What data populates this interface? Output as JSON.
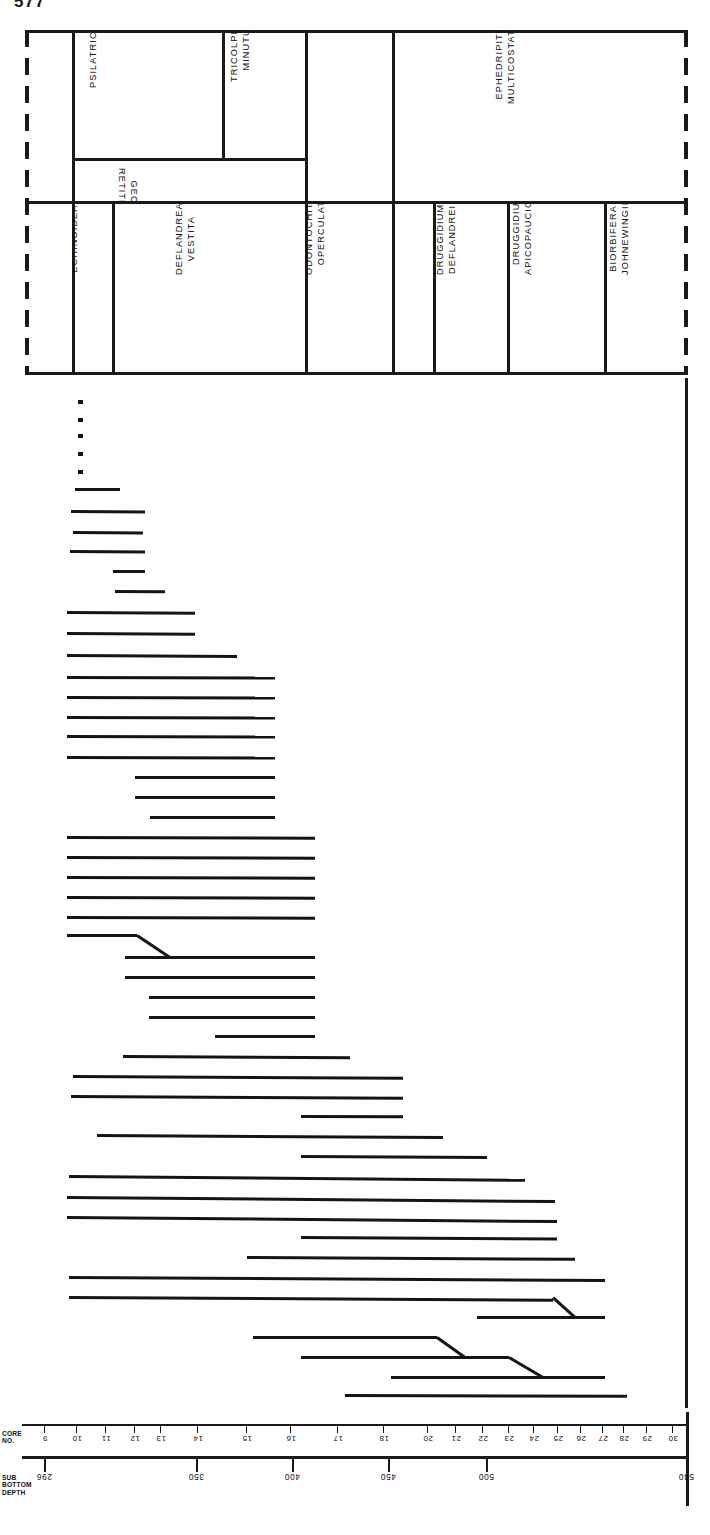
{
  "page_number": "577",
  "header": {
    "top_row": [
      {
        "id": "complexiopollis",
        "label": "COMPLEXIOPOLLIS",
        "lines": [
          "COMPLEXIOPOLLIS"
        ],
        "x": 0,
        "w": 47,
        "orient": "ccw"
      },
      {
        "id": "psilatricolporites",
        "label": "PSILATRICOLPORITES",
        "lines": [
          "PSILATRICOLPORITES"
        ],
        "x": 47,
        "w": 150,
        "orient": "ccw"
      },
      {
        "id": "tricolpites-minutus",
        "label": "TRICOLPITES MINUTUS",
        "lines": [
          "TRICOLPITES",
          "MINUTUS"
        ],
        "x": 197,
        "w": 83,
        "orient": "ccw"
      },
      {
        "id": "clavatipollenites",
        "label": "CLAVATIPOLLENITES",
        "lines": [
          "CLAVATIPOLLENITES"
        ],
        "x": 280,
        "w": 87,
        "orient": "ccw"
      },
      {
        "id": "ephedripites-multicostatus",
        "label": "EPHEDRIPITES MULTICOSTATUS",
        "lines": [
          "EPHEDRIPITES",
          "MULTICOSTATUS"
        ],
        "x": 367,
        "w": 296,
        "orient": "ccw"
      }
    ],
    "inset_row": [
      {
        "id": "retitricolpites-georgensis",
        "label": "RETITRICOLPITES GEORGENSIS",
        "lines": [
          "GEORGENSIS",
          "RETITRICOLPITES"
        ],
        "orient": "cw"
      }
    ],
    "bottom_row": [
      {
        "id": "trithyrodinium-suspectum",
        "label": "TRITHYRODINIUM SUSPECTUM",
        "lines": [
          "TRITHYRODINIUM",
          "SUSPECTUM"
        ],
        "x": 0,
        "w": 47,
        "orient": "ccw"
      },
      {
        "id": "deflandrea-echinoidea",
        "label": "DEFLANDREA ECHINOIDEA",
        "lines": [
          "DEFLANDREA",
          "ECHINOIDEA"
        ],
        "x": 47,
        "w": 40,
        "orient": "ccw"
      },
      {
        "id": "deflandrea-vestita",
        "label": "DEFLANDREA VESTITA",
        "lines": [
          "DEFLANDREA",
          "VESTITA"
        ],
        "x": 87,
        "w": 193,
        "orient": "ccw"
      },
      {
        "id": "odontochitina-operculata",
        "label": "ODONTOCHITINA OPERCULATA",
        "lines": [
          "ODONTOCHITINA",
          "OPERCULATA"
        ],
        "x": 280,
        "w": 87,
        "orient": "ccw"
      },
      {
        "id": "druggidium-rhabdoreticulatum",
        "label": "DRUGGIDIUM RHABDORETICULATUM",
        "lines": [
          "DRUGGIDIUM",
          "RHABDORETICULATUM"
        ],
        "x": 367,
        "w": 41,
        "orient": "ccw"
      },
      {
        "id": "druggidium-deflandrei",
        "label": "DRUGGIDIUM DEFLANDREI",
        "lines": [
          "DRUGGIDIUM",
          "DEFLANDREI"
        ],
        "x": 408,
        "w": 74,
        "orient": "ccw"
      },
      {
        "id": "druggidium-apicopaucicum",
        "label": "DRUGGIDIUM APICOPAUCICUM",
        "lines": [
          "DRUGGIDIUM",
          "APICOPAUCICUM"
        ],
        "x": 482,
        "w": 97,
        "orient": "ccw"
      },
      {
        "id": "biorbifera-johnewingii",
        "label": "BIORBIFERA JOHNEWINGII",
        "lines": [
          "BIORBIFERA",
          "JOHNEWINGII"
        ],
        "x": 579,
        "w": 84,
        "orient": "ccw"
      }
    ]
  },
  "axis": {
    "core_title_lines": [
      "CORE",
      "NO."
    ],
    "depth_title_lines": [
      "SUB",
      "BOTTOM",
      "DEPTH"
    ],
    "core_numbers": [
      "9",
      "10",
      "11",
      "12",
      "13",
      "14",
      "15",
      "16",
      "17",
      "18",
      "20",
      "21",
      "22",
      "23",
      "24",
      "25",
      "26",
      "27",
      "28",
      "29",
      "30"
    ],
    "core_tick_x": [
      44,
      76,
      105,
      134,
      160,
      197,
      246,
      290,
      337,
      383,
      427,
      455,
      482,
      508,
      533,
      557,
      580,
      602,
      623,
      646,
      672
    ],
    "depth_labels": [
      "296",
      "350",
      "400",
      "450",
      "500",
      "540"
    ],
    "depth_tick_x": [
      44,
      196,
      292,
      388,
      486,
      686
    ]
  },
  "chart_data": {
    "type": "range-chart",
    "xlabel": "SUB BOTTOM DEPTH",
    "ylabel": "Taxa",
    "xlim": [
      296,
      540
    ],
    "grid": false,
    "legend": null,
    "note": "Each horizontal line is the observed depth range (m) of one taxon; short squares are single-occurrence records; stepped lines indicate range offsets between adjacent taxa.",
    "ranges": [
      {
        "row": 1,
        "start": 300,
        "end": 302,
        "kind": "dot"
      },
      {
        "row": 2,
        "start": 300,
        "end": 302,
        "kind": "dot"
      },
      {
        "row": 3,
        "start": 300,
        "end": 302,
        "kind": "dot"
      },
      {
        "row": 4,
        "start": 300,
        "end": 302,
        "kind": "dot"
      },
      {
        "row": 5,
        "start": 300,
        "end": 302,
        "kind": "dot"
      },
      {
        "row": 6,
        "start": 299,
        "end": 319,
        "kind": "bar"
      },
      {
        "row": 7,
        "start": 298,
        "end": 339,
        "kind": "bar"
      },
      {
        "row": 8,
        "start": 299,
        "end": 339,
        "kind": "bar"
      },
      {
        "row": 9,
        "start": 298,
        "end": 340,
        "kind": "bar"
      },
      {
        "row": 10,
        "start": 314,
        "end": 340,
        "kind": "bar"
      },
      {
        "row": 11,
        "start": 318,
        "end": 355,
        "kind": "bar"
      },
      {
        "row": 12,
        "start": 296,
        "end": 379,
        "kind": "bar"
      },
      {
        "row": 13,
        "start": 296,
        "end": 381,
        "kind": "bar"
      },
      {
        "row": 14,
        "start": 296,
        "end": 398,
        "kind": "bar"
      },
      {
        "row": 15,
        "start": 296,
        "end": 428,
        "kind": "bar"
      },
      {
        "row": 16,
        "start": 296,
        "end": 428,
        "kind": "bar"
      },
      {
        "row": 17,
        "start": 296,
        "end": 428,
        "kind": "bar"
      },
      {
        "row": 18,
        "start": 296,
        "end": 428,
        "kind": "bar"
      },
      {
        "row": 19,
        "start": 296,
        "end": 428,
        "kind": "bar"
      },
      {
        "row": 20,
        "start": 316,
        "end": 428,
        "kind": "bar"
      },
      {
        "row": 21,
        "start": 316,
        "end": 428,
        "kind": "bar"
      },
      {
        "row": 22,
        "start": 322,
        "end": 428,
        "kind": "bar"
      },
      {
        "row": 23,
        "start": 296,
        "end": 431,
        "kind": "bar"
      },
      {
        "row": 24,
        "start": 296,
        "end": 431,
        "kind": "bar"
      },
      {
        "row": 25,
        "start": 296,
        "end": 431,
        "kind": "bar"
      },
      {
        "row": 26,
        "start": 296,
        "end": 431,
        "kind": "bar"
      },
      {
        "row": 27,
        "start": 296,
        "end": 431,
        "kind": "bar"
      },
      {
        "row": 28,
        "start": 296,
        "end": 431,
        "kind": "bar",
        "kink_to": 316
      },
      {
        "row": 29,
        "start": 316,
        "end": 431,
        "kind": "bar"
      },
      {
        "row": 30,
        "start": 316,
        "end": 431,
        "kind": "bar"
      },
      {
        "row": 31,
        "start": 324,
        "end": 431,
        "kind": "bar"
      },
      {
        "row": 32,
        "start": 324,
        "end": 431,
        "kind": "bar"
      },
      {
        "row": 33,
        "start": 348,
        "end": 431,
        "kind": "bar"
      },
      {
        "row": 34,
        "start": 322,
        "end": 448,
        "kind": "bar"
      },
      {
        "row": 35,
        "start": 296,
        "end": 468,
        "kind": "bar"
      },
      {
        "row": 36,
        "start": 296,
        "end": 468,
        "kind": "bar"
      },
      {
        "row": 37,
        "start": 400,
        "end": 468,
        "kind": "bar"
      },
      {
        "row": 38,
        "start": 308,
        "end": 498,
        "kind": "bar"
      },
      {
        "row": 39,
        "start": 400,
        "end": 510,
        "kind": "bar"
      },
      {
        "row": 40,
        "start": 296,
        "end": 524,
        "kind": "bar"
      },
      {
        "row": 41,
        "start": 296,
        "end": 536,
        "kind": "bar"
      },
      {
        "row": 42,
        "start": 296,
        "end": 538,
        "kind": "bar"
      },
      {
        "row": 43,
        "start": 400,
        "end": 538,
        "kind": "bar"
      },
      {
        "row": 44,
        "start": 400,
        "end": 538,
        "kind": "bar"
      },
      {
        "row": 45,
        "start": 376,
        "end": 538,
        "kind": "bar"
      },
      {
        "row": 46,
        "start": 296,
        "end": 540,
        "kind": "bar"
      },
      {
        "row": 47,
        "start": 296,
        "end": 540,
        "kind": "bar",
        "kink_to": 466
      },
      {
        "row": 48,
        "start": 466,
        "end": 540,
        "kind": "bar"
      },
      {
        "row": 49,
        "start": 376,
        "end": 506,
        "kind": "bar",
        "kink_to": 420
      },
      {
        "row": 50,
        "start": 400,
        "end": 512,
        "kind": "bar",
        "kink_to": 436
      },
      {
        "row": 51,
        "start": 428,
        "end": 540,
        "kind": "bar"
      },
      {
        "row": 52,
        "start": 406,
        "end": 550,
        "kind": "bar"
      },
      {
        "row": 53,
        "start": 296,
        "end": 562,
        "kind": "bar"
      },
      {
        "row": 54,
        "start": 338,
        "end": 562,
        "kind": "bar"
      },
      {
        "row": 55,
        "start": 348,
        "end": 562,
        "kind": "bar"
      },
      {
        "row": 56,
        "start": 368,
        "end": 562,
        "kind": "bar"
      },
      {
        "row": 57,
        "start": 402,
        "end": 562,
        "kind": "bar"
      },
      {
        "row": 58,
        "start": 402,
        "end": 562,
        "kind": "bar"
      },
      {
        "row": 59,
        "start": 420,
        "end": 562,
        "kind": "bar"
      },
      {
        "row": 60,
        "start": 466,
        "end": 562,
        "kind": "bar"
      },
      {
        "row": 61,
        "start": 466,
        "end": 572,
        "kind": "bar"
      },
      {
        "row": 62,
        "start": 480,
        "end": 572,
        "kind": "bar"
      },
      {
        "row": 63,
        "start": 480,
        "end": 572,
        "kind": "bar"
      },
      {
        "row": 64,
        "start": 542,
        "end": 572,
        "kind": "bar"
      },
      {
        "row": 65,
        "start": 542,
        "end": 572,
        "kind": "bar"
      }
    ]
  },
  "plot_geometry": {
    "note": "Pixel geometry of the range bars within the plot box (663x1030). left/right in px, top in px.",
    "bars": [
      {
        "l": 53,
        "r": 58,
        "t": 22,
        "dot": true
      },
      {
        "l": 53,
        "r": 58,
        "t": 40,
        "dot": true
      },
      {
        "l": 53,
        "r": 58,
        "t": 56,
        "dot": true
      },
      {
        "l": 53,
        "r": 58,
        "t": 74,
        "dot": true
      },
      {
        "l": 53,
        "r": 58,
        "t": 92,
        "dot": true
      },
      {
        "l": 50,
        "r": 95,
        "t": 110,
        "slope": 0
      },
      {
        "l": 46,
        "r": 120,
        "t": 132,
        "slope": 2
      },
      {
        "l": 48,
        "r": 118,
        "t": 153,
        "slope": 2
      },
      {
        "l": 45,
        "r": 120,
        "t": 172,
        "slope": 2
      },
      {
        "l": 88,
        "r": 120,
        "t": 192,
        "slope": 1
      },
      {
        "l": 90,
        "r": 140,
        "t": 212,
        "slope": 1
      },
      {
        "l": 42,
        "r": 170,
        "t": 233,
        "slope": 2
      },
      {
        "l": 42,
        "r": 170,
        "t": 254,
        "slope": 2
      },
      {
        "l": 42,
        "r": 212,
        "t": 276,
        "slope": 2
      },
      {
        "l": 42,
        "r": 250,
        "t": 298,
        "slope": 1
      },
      {
        "l": 42,
        "r": 250,
        "t": 318,
        "slope": 1
      },
      {
        "l": 42,
        "r": 250,
        "t": 338,
        "slope": 1
      },
      {
        "l": 42,
        "r": 250,
        "t": 357,
        "slope": 1
      },
      {
        "l": 42,
        "r": 250,
        "t": 378,
        "slope": 1
      },
      {
        "l": 110,
        "r": 250,
        "t": 398,
        "slope": 0
      },
      {
        "l": 110,
        "r": 250,
        "t": 418,
        "slope": 0
      },
      {
        "l": 125,
        "r": 250,
        "t": 438,
        "slope": 0
      },
      {
        "l": 42,
        "r": 290,
        "t": 458,
        "slope": 1
      },
      {
        "l": 42,
        "r": 290,
        "t": 478,
        "slope": 1
      },
      {
        "l": 42,
        "r": 290,
        "t": 498,
        "slope": 1
      },
      {
        "l": 42,
        "r": 290,
        "t": 518,
        "slope": 1
      },
      {
        "l": 42,
        "r": 290,
        "t": 538,
        "slope": 1
      },
      {
        "l": 42,
        "r": 112,
        "t": 556,
        "slope": 0,
        "kink": {
          "x2": 145,
          "y2": 578
        }
      },
      {
        "l": 100,
        "r": 290,
        "t": 578,
        "slope": 0
      },
      {
        "l": 100,
        "r": 290,
        "t": 598,
        "slope": 0
      },
      {
        "l": 124,
        "r": 290,
        "t": 618,
        "slope": 0
      },
      {
        "l": 124,
        "r": 290,
        "t": 638,
        "slope": 0
      },
      {
        "l": 190,
        "r": 290,
        "t": 657,
        "slope": 0
      },
      {
        "l": 98,
        "r": 325,
        "t": 677,
        "slope": 2
      },
      {
        "l": 48,
        "r": 378,
        "t": 697,
        "slope": 2
      },
      {
        "l": 46,
        "r": 378,
        "t": 717,
        "slope": 2
      },
      {
        "l": 276,
        "r": 378,
        "t": 737,
        "slope": 1
      },
      {
        "l": 72,
        "r": 418,
        "t": 756,
        "slope": 2
      },
      {
        "l": 276,
        "r": 462,
        "t": 777,
        "slope": 2
      },
      {
        "l": 44,
        "r": 500,
        "t": 797,
        "slope": 3
      },
      {
        "l": 42,
        "r": 530,
        "t": 818,
        "slope": 3
      },
      {
        "l": 42,
        "r": 532,
        "t": 838,
        "slope": 3
      },
      {
        "l": 276,
        "r": 532,
        "t": 858,
        "slope": 2
      },
      {
        "l": 222,
        "r": 550,
        "t": 878,
        "slope": 2
      },
      {
        "l": 44,
        "r": 580,
        "t": 898,
        "slope": 2
      },
      {
        "l": 44,
        "r": 528,
        "t": 918,
        "slope": 2,
        "kink": {
          "x2": 550,
          "y2": 938
        }
      },
      {
        "l": 452,
        "r": 580,
        "t": 938,
        "slope": 0
      },
      {
        "l": 228,
        "r": 412,
        "t": 958,
        "slope": 0,
        "kink": {
          "x2": 440,
          "y2": 978
        }
      },
      {
        "l": 276,
        "r": 484,
        "t": 978,
        "slope": 0,
        "kink": {
          "x2": 518,
          "y2": 998
        }
      },
      {
        "l": 366,
        "r": 580,
        "t": 998,
        "slope": 0
      },
      {
        "l": 320,
        "r": 602,
        "t": 1016,
        "slope": 1
      }
    ]
  }
}
